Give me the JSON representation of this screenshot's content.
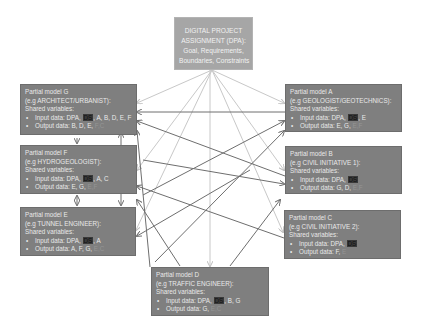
{
  "top": {
    "lines": [
      "DIGITAL PROJECT",
      "ASSIGNMENT (DPA):",
      "Goal, Requirements,",
      "Boundaries, Constraints"
    ]
  },
  "models": {
    "G": {
      "title": "Partial model G",
      "role": "(e.g ARCHITECT/URBANIST):",
      "shared": "Shared variables:",
      "input_label": "Input data: DPA,",
      "ds": "DS",
      "input_rest": ", A, B, D, E, F",
      "output_label": "Output data: B, D, E,",
      "output_faded": "F,C"
    },
    "F": {
      "title": "Partial model F",
      "role": "(e.g HYDROGEOLOGIST):",
      "shared": "Shared variables:",
      "input_label": "Input data: DPA,",
      "ds": "DS",
      "input_rest": ", A, C",
      "output_label": "Output data: E, G,",
      "output_faded": "E,F"
    },
    "E": {
      "title": "Partial model E",
      "role": "(e.g TUNNEL ENGINEER):",
      "shared": "Shared variables:",
      "input_label": "Input data: DPA,",
      "ds": "DS",
      "input_rest": ", A",
      "output_label": "Output data: A, F, G,",
      "output_faded": "E,C"
    },
    "A": {
      "title": "Partial model A",
      "role": "(e.g GEOLOGIST/GEOTECHNICS):",
      "shared": "Shared variables:",
      "input_label": "Input data: DPA,",
      "ds": "DS",
      "input_rest": ", E",
      "output_label": "Output data: E, G,",
      "output_faded": "E,F"
    },
    "B": {
      "title": "Partial model B",
      "role": "(e.g CIVIL INITIATIVE 1):",
      "shared": "Shared variables:",
      "input_label": "Input data: DPA,",
      "ds": "DS",
      "input_rest": "",
      "output_label": "Output data: G, D,",
      "output_faded": "E,F"
    },
    "C": {
      "title": "Partial model C",
      "role": "(e.g CIVIL INITIATIVE 2):",
      "shared": "Shared variables:",
      "input_label": "Input data: DPA,",
      "ds": "DS",
      "input_rest": "",
      "output_label": "Output data: F,",
      "output_faded": "E"
    },
    "D": {
      "title": "Partial model D",
      "role": "(e.g TRAFFIC ENGINEER):",
      "shared": "Shared variables:",
      "input_label": "Input data: DPA,",
      "ds": "DS",
      "input_rest": ", B, G",
      "output_label": "Output data: G,",
      "output_faded": "E,C"
    }
  },
  "colors": {
    "box_dark": "#7f7f7f",
    "box_top": "#a6a6a6",
    "arrow_light": "#c8c8c8",
    "arrow_dark": "#6e6e6e"
  }
}
